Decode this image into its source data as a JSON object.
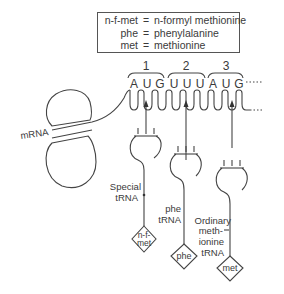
{
  "legend": {
    "rows": [
      {
        "abbr": "n-f-met",
        "eq": "=",
        "def": "n-formyl methionine"
      },
      {
        "abbr": "phe",
        "eq": "=",
        "def": "phenylalanine"
      },
      {
        "abbr": "met",
        "eq": "=",
        "def": "methionine"
      }
    ]
  },
  "codons": [
    {
      "number": "1",
      "bases": [
        "A",
        "U",
        "G"
      ]
    },
    {
      "number": "2",
      "bases": [
        "U",
        "U",
        "U"
      ]
    },
    {
      "number": "3",
      "bases": [
        "A",
        "U",
        "G"
      ]
    }
  ],
  "labels": {
    "mrna": "mRNA",
    "special_trna_line1": "Special",
    "special_trna_line2": "tRNA",
    "phe_trna_line1": "phe",
    "phe_trna_line2": "tRNA",
    "ordinary_line1": "Ordinary",
    "ordinary_line2": "meth-",
    "ordinary_line3": "ionine",
    "ordinary_line4": "tRNA"
  },
  "amino_acids": [
    {
      "line1": "n-f-",
      "line2": "met"
    },
    {
      "line1": "phe"
    },
    {
      "line1": "met"
    }
  ]
}
